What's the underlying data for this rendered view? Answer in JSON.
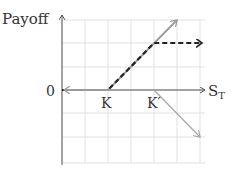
{
  "diagram": {
    "title": "Payoff",
    "y_origin_label": "0",
    "x_axis_label_main": "S",
    "x_axis_label_sub": "T",
    "strike_labels": [
      "K",
      "K′"
    ],
    "colors": {
      "grid": "#d9d9d9",
      "axis": "#555555",
      "long_call": "#9a9a9a",
      "short_call": "#a8a8a8",
      "spread": "#222222",
      "text": "#333333"
    },
    "grid": {
      "x_lines": [
        62,
        85,
        108,
        131,
        154,
        177,
        200
      ],
      "y_lines": [
        20,
        43,
        67,
        90,
        113,
        137,
        163
      ]
    },
    "axes": {
      "origin": [
        62,
        90
      ],
      "x_end": 205,
      "y_top": 15,
      "y_bottom": 165
    },
    "series": [
      {
        "name": "long-call-K",
        "style": "solid-gray",
        "points": [
          [
            108,
            90
          ],
          [
            177,
            20
          ]
        ]
      },
      {
        "name": "short-call-K-prime",
        "style": "solid-light-gray",
        "points": [
          [
            154,
            90
          ],
          [
            200,
            137
          ]
        ]
      },
      {
        "name": "bull-spread",
        "style": "dashed-black",
        "points": [
          [
            62,
            90
          ],
          [
            108,
            90
          ],
          [
            154,
            43
          ],
          [
            202,
            43
          ]
        ]
      }
    ]
  }
}
